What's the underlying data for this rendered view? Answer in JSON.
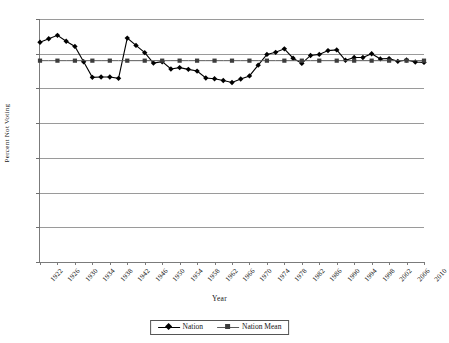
{
  "chart_data": {
    "type": "line",
    "title": "",
    "xlabel": "Year",
    "ylabel": "Percent Not Voting",
    "ylim": [
      0,
      70
    ],
    "ytick_step": 10,
    "yticks": [
      0,
      10,
      20,
      30,
      40,
      50,
      60,
      70
    ],
    "xlim": [
      1922,
      2010
    ],
    "xtick_step": 4,
    "xticks": [
      1922,
      1926,
      1930,
      1934,
      1938,
      1942,
      1946,
      1950,
      1954,
      1958,
      1962,
      1966,
      1970,
      1974,
      1978,
      1982,
      1986,
      1990,
      1994,
      1998,
      2002,
      2006,
      2010
    ],
    "grid": true,
    "legend_position": "bottom-center",
    "x": [
      1922,
      1924,
      1926,
      1928,
      1930,
      1932,
      1934,
      1936,
      1938,
      1940,
      1942,
      1944,
      1946,
      1948,
      1950,
      1952,
      1954,
      1956,
      1958,
      1960,
      1962,
      1964,
      1966,
      1968,
      1970,
      1972,
      1974,
      1976,
      1978,
      1980,
      1982,
      1984,
      1986,
      1988,
      1990,
      1992,
      1994,
      1996,
      1998,
      2000,
      2002,
      2004,
      2006,
      2008,
      2010
    ],
    "series": [
      {
        "name": "Nation",
        "color": "#000000",
        "marker": "diamond",
        "values": [
          63.3,
          64.3,
          65.3,
          63.6,
          62.1,
          57.7,
          53.2,
          53.3,
          53.3,
          52.9,
          64.5,
          62.4,
          60.3,
          57.3,
          57.7,
          55.6,
          56.0,
          55.5,
          55.0,
          53.0,
          52.8,
          52.3,
          51.7,
          52.7,
          53.6,
          56.7,
          59.8,
          60.4,
          61.4,
          58.7,
          57.2,
          59.5,
          59.8,
          60.9,
          61.1,
          58.1,
          58.9,
          58.9,
          60.0,
          58.5,
          58.6,
          57.8,
          58.2,
          57.6,
          57.5
        ]
      },
      {
        "name": "Nation Mean",
        "color": "#5a5a5a",
        "marker": "square",
        "values": [
          58.0,
          58.0,
          58.0,
          58.0,
          58.0,
          58.0,
          58.0,
          58.0,
          58.0,
          58.0,
          58.0,
          58.0,
          58.0,
          58.0,
          58.0,
          58.0,
          58.0,
          58.0,
          58.0,
          58.0,
          58.0,
          58.0,
          58.0,
          58.0,
          58.0,
          58.0,
          58.0,
          58.0,
          58.0,
          58.0,
          58.0,
          58.0,
          58.0,
          58.0,
          58.0,
          58.0,
          58.0,
          58.0,
          58.0,
          58.0,
          58.0,
          58.0,
          58.0,
          58.0,
          58.0
        ]
      }
    ],
    "legend": [
      {
        "label": "Nation",
        "marker": "diamond",
        "color": "#000000"
      },
      {
        "label": "Nation Mean",
        "marker": "square",
        "color": "#5a5a5a"
      }
    ]
  }
}
